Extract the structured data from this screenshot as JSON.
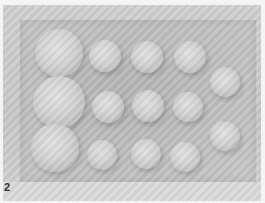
{
  "figure": {
    "panel_label": "2",
    "colors": {
      "background": "#f4f4f4",
      "tray": "#bdbdbd",
      "dome_highlight": "#e2e2e2",
      "dome_shadow": "#a9a9a9"
    },
    "domes": [
      {
        "cx": 59,
        "cy": 53,
        "r": 24
      },
      {
        "cx": 105,
        "cy": 56,
        "r": 16
      },
      {
        "cx": 147,
        "cy": 57,
        "r": 16
      },
      {
        "cx": 190,
        "cy": 57,
        "r": 16
      },
      {
        "cx": 225,
        "cy": 82,
        "r": 15
      },
      {
        "cx": 59,
        "cy": 102,
        "r": 26
      },
      {
        "cx": 108,
        "cy": 107,
        "r": 16
      },
      {
        "cx": 148,
        "cy": 106,
        "r": 16
      },
      {
        "cx": 188,
        "cy": 107,
        "r": 15
      },
      {
        "cx": 225,
        "cy": 136,
        "r": 15
      },
      {
        "cx": 55,
        "cy": 148,
        "r": 24
      },
      {
        "cx": 102,
        "cy": 155,
        "r": 15
      },
      {
        "cx": 146,
        "cy": 154,
        "r": 15
      },
      {
        "cx": 185,
        "cy": 157,
        "r": 15
      }
    ]
  }
}
